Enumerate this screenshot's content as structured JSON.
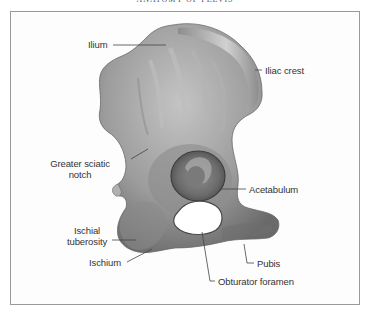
{
  "header": {
    "title": "ANATOMY OF PELVIS"
  },
  "figure": {
    "colors": {
      "bone": "#9a9a9a",
      "bone_light": "#c8c8c8",
      "bone_dark": "#5e5e5e",
      "leader_line": "#444444",
      "border": "#9a9a9a"
    },
    "labels": {
      "ilium": "Ilium",
      "iliac_crest": "Iliac crest",
      "greater_sciatic_notch_line1": "Greater sciatic",
      "greater_sciatic_notch_line2": "notch",
      "acetabulum": "Acetabulum",
      "ischial_tuberosity_line1": "Ischial",
      "ischial_tuberosity_line2": "tuberosity",
      "ischium": "Ischium",
      "pubis": "Pubis",
      "obturator_foramen": "Obturator foramen"
    }
  }
}
